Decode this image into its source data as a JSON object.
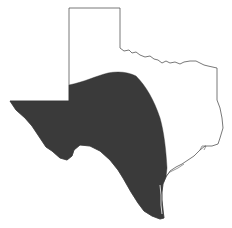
{
  "map": {
    "region": "Texas",
    "description": "Outline map of Texas with shaded distribution range covering West, Central and South Texas",
    "colors": {
      "background": "#ffffff",
      "outline": "#555555",
      "range_fill": "#3a3a3a"
    },
    "layers": [
      {
        "name": "state-outline",
        "type": "outline"
      },
      {
        "name": "distribution-range",
        "type": "shaded-area"
      }
    ]
  }
}
